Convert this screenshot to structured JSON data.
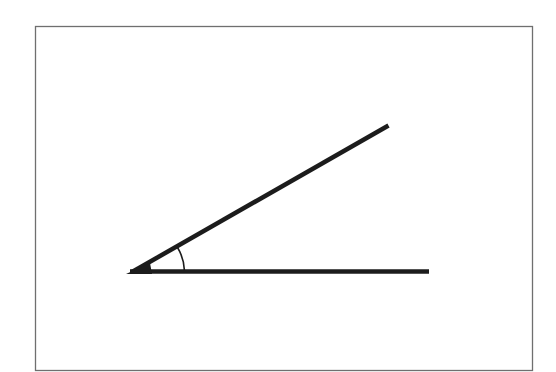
{
  "diagram": {
    "title": "",
    "frame": {
      "x": 35,
      "y": 26,
      "width": 497,
      "height": 344,
      "stroke": "#6f6f6f"
    },
    "vertex": {
      "x": 135,
      "y": 272
    },
    "rays": [
      {
        "name": "upper-ray",
        "x2": 388,
        "y2": 126
      },
      {
        "name": "horizontal-ray",
        "x2": 429,
        "y2": 272
      }
    ],
    "angle_arc": {
      "radius": 58,
      "label": ""
    },
    "stroke_color": "#1c1c1c"
  }
}
